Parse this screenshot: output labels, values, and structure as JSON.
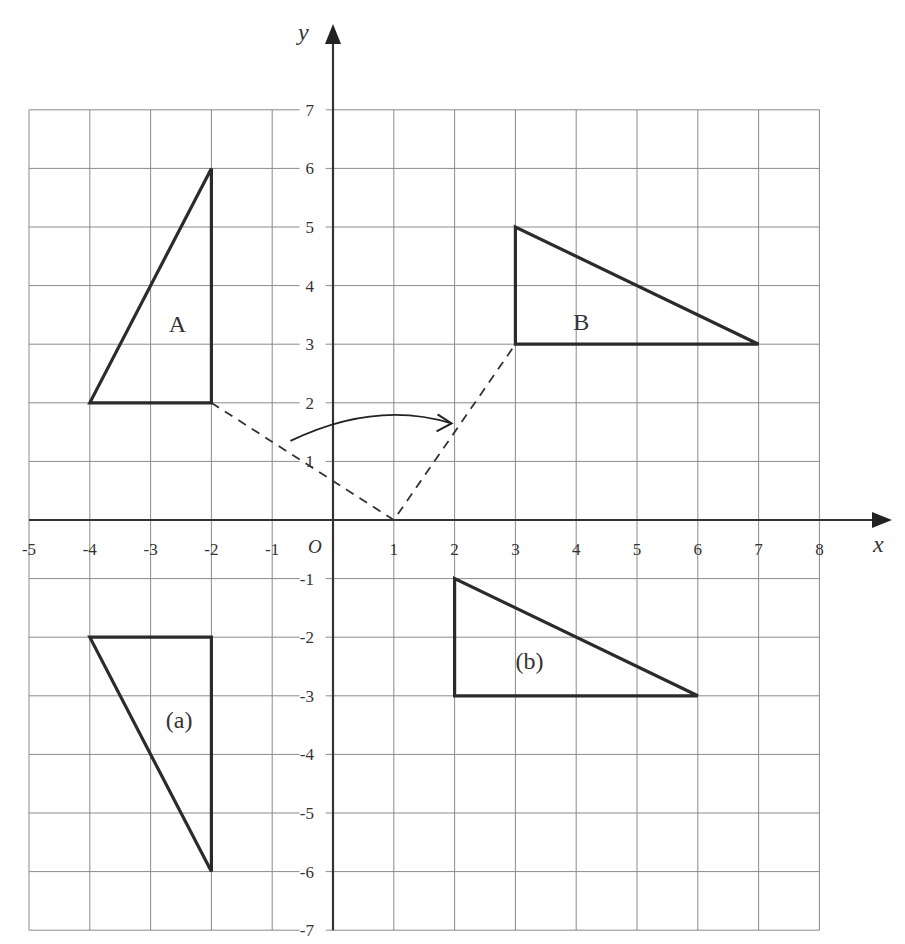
{
  "diagram": {
    "title": "",
    "axes": {
      "x_label": "x",
      "y_label": "y",
      "origin_label": "O",
      "x_ticks": [
        "-5",
        "-4",
        "-3",
        "-2",
        "-1",
        "1",
        "2",
        "3",
        "4",
        "5",
        "6",
        "7",
        "8"
      ],
      "x_tick_values": [
        -5,
        -4,
        -3,
        -2,
        -1,
        1,
        2,
        3,
        4,
        5,
        6,
        7,
        8
      ],
      "y_ticks": [
        "7",
        "6",
        "5",
        "4",
        "3",
        "2",
        "1",
        "-1",
        "-2",
        "-3",
        "-4",
        "-5",
        "-6",
        "-7"
      ],
      "y_tick_values": [
        7,
        6,
        5,
        4,
        3,
        2,
        1,
        -1,
        -2,
        -3,
        -4,
        -5,
        -6,
        -7
      ],
      "x_range": [
        -5,
        8
      ],
      "y_range": [
        -7,
        7
      ]
    },
    "grid": {
      "x_min": -5,
      "x_max": 8,
      "y_min": -7,
      "y_max": 7,
      "color": "#8a8a8a"
    },
    "shapes": [
      {
        "id": "A",
        "label": "A",
        "vertices": [
          [
            -4,
            2
          ],
          [
            -2,
            2
          ],
          [
            -2,
            6
          ]
        ],
        "label_pos": [
          -2.7,
          3.2
        ]
      },
      {
        "id": "B",
        "label": "B",
        "vertices": [
          [
            3,
            3
          ],
          [
            7,
            3
          ],
          [
            3,
            5
          ]
        ],
        "label_pos": [
          3.95,
          3.25
        ]
      },
      {
        "id": "a",
        "label": "(a)",
        "vertices": [
          [
            -4,
            -2
          ],
          [
            -2,
            -2
          ],
          [
            -2,
            -6
          ]
        ],
        "label_pos": [
          -2.75,
          -3.55
        ]
      },
      {
        "id": "b",
        "label": "(b)",
        "vertices": [
          [
            2,
            -3
          ],
          [
            6,
            -3
          ],
          [
            2,
            -1
          ]
        ],
        "label_pos": [
          3.0,
          -2.55
        ]
      }
    ],
    "rotation_guides": {
      "center": [
        1,
        0
      ],
      "from_point": [
        -2,
        2
      ],
      "to_point": [
        3,
        3
      ],
      "arrow": {
        "start": [
          -0.7,
          1.35
        ],
        "control": [
          0.7,
          2.05
        ],
        "end": [
          1.95,
          1.65
        ]
      }
    },
    "colors": {
      "shape_stroke": "#2b2b2b",
      "axis": "#333333",
      "text": "#333333"
    }
  }
}
